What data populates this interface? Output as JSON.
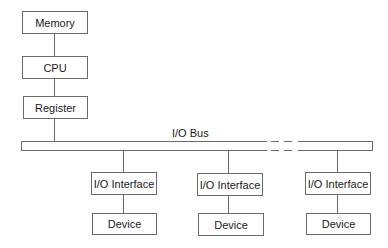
{
  "diagram": {
    "type": "block-diagram",
    "colors": {
      "line": "#6a6a6a",
      "text": "#1a1a1a",
      "background": "#ffffff"
    },
    "cpu_stack": [
      {
        "id": "memory",
        "label": "Memory"
      },
      {
        "id": "cpu",
        "label": "CPU"
      },
      {
        "id": "register",
        "label": "Register"
      }
    ],
    "bus": {
      "label": "I/O Bus",
      "has_ellipsis_gap": true
    },
    "io_branches": [
      {
        "interface": "I/O Interface",
        "device": "Device"
      },
      {
        "interface": "I/O Interface",
        "device": "Device"
      },
      {
        "interface": "I/O Interface",
        "device": "Device"
      }
    ],
    "edges": [
      [
        "Memory",
        "CPU"
      ],
      [
        "CPU",
        "Register"
      ],
      [
        "Register",
        "I/O Bus"
      ],
      [
        "I/O Bus",
        "I/O Interface 1"
      ],
      [
        "I/O Bus",
        "I/O Interface 2"
      ],
      [
        "I/O Bus",
        "I/O Interface 3"
      ],
      [
        "I/O Interface 1",
        "Device 1"
      ],
      [
        "I/O Interface 2",
        "Device 2"
      ],
      [
        "I/O Interface 3",
        "Device 3"
      ]
    ]
  }
}
